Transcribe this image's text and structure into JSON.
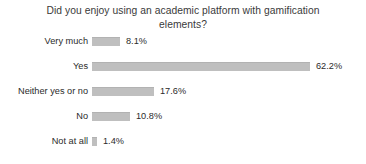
{
  "chart_data": {
    "type": "bar",
    "orientation": "horizontal",
    "title": "Did you enjoy using an academic platform with gamification\nelements?",
    "categories": [
      "Very much",
      "Yes",
      "Neither yes or no",
      "No",
      "Not at all"
    ],
    "values": [
      8.1,
      62.2,
      17.6,
      10.8,
      1.4
    ],
    "value_labels": [
      "8.1%",
      "62.2%",
      "17.6%",
      "10.8%",
      "1.4%"
    ],
    "xlabel": "",
    "ylabel": "",
    "xlim": [
      0,
      70
    ],
    "grid": false,
    "legend": false,
    "bar_color": "#bfbfbf",
    "text_color": "#2b2b2b",
    "background": "#ffffff"
  }
}
